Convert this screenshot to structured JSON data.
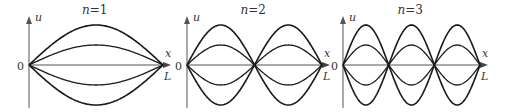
{
  "figure": {
    "axis_y_label": "u",
    "axis_x_label": "x",
    "origin_label": "0",
    "end_label": "L",
    "stroke_color": "#1a1a1a",
    "panels": [
      {
        "title": "n=1",
        "n": 1,
        "n_var": "n",
        "n_val": "=1",
        "x0": 29,
        "x1": 163
      },
      {
        "title": "n=2",
        "n": 2,
        "n_var": "n",
        "n_val": "=2",
        "x0": 187,
        "x1": 322
      },
      {
        "title": "n=3",
        "n": 3,
        "n_var": "n",
        "n_val": "=3",
        "x0": 343,
        "x1": 480
      }
    ],
    "amplitudes": [
      40,
      20,
      -20,
      -40
    ],
    "axis_baseline_y": 65
  }
}
